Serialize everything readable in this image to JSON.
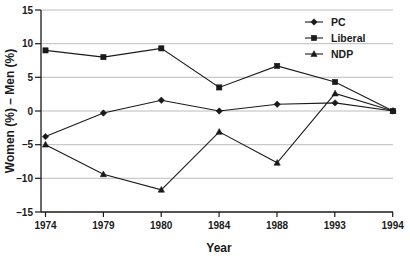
{
  "chart_data": {
    "type": "line",
    "title": "",
    "xlabel": "Year",
    "ylabel": "Women (%) – Men (%)",
    "categories": [
      "1974",
      "1979",
      "1980",
      "1984",
      "1988",
      "1993",
      "1994"
    ],
    "ylim": [
      -15,
      15
    ],
    "yticks": [
      -15,
      -10,
      -5,
      0,
      5,
      10,
      15
    ],
    "ytick_labels": [
      "–15",
      "–10",
      "–5",
      "0",
      "5",
      "10",
      "15"
    ],
    "grid": "horizontal",
    "legend_position": "top-right",
    "series": [
      {
        "name": "PC",
        "marker": "diamond",
        "color": "#1a1a1a",
        "values": [
          -3.8,
          -0.3,
          1.6,
          0.0,
          1.0,
          1.2,
          0.0
        ]
      },
      {
        "name": "Liberal",
        "marker": "square",
        "color": "#1a1a1a",
        "values": [
          9.0,
          8.0,
          9.3,
          3.5,
          6.7,
          4.3,
          0.0
        ]
      },
      {
        "name": "NDP",
        "marker": "triangle",
        "color": "#1a1a1a",
        "values": [
          -5.0,
          -9.4,
          -11.7,
          -3.1,
          -7.7,
          2.6,
          0.0
        ]
      }
    ]
  },
  "axis": {
    "x_title": "Year",
    "y_title": "Women (%) – Men (%)"
  },
  "legend": {
    "items": [
      {
        "label": "PC"
      },
      {
        "label": "Liberal"
      },
      {
        "label": "NDP"
      }
    ]
  },
  "xtick_labels": {
    "t0": "1974",
    "t1": "1979",
    "t2": "1980",
    "t3": "1984",
    "t4": "1988",
    "t5": "1993",
    "t6": "1994"
  },
  "ytick_labels": {
    "t0": "15",
    "t1": "10",
    "t2": "5",
    "t3": "0",
    "t4": "–5",
    "t5": "–10",
    "t6": "–15"
  }
}
